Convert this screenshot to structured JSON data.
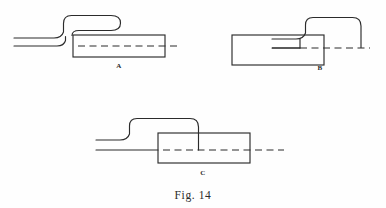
{
  "figure": {
    "caption": "Fig. 14",
    "background_color": "#fefefe",
    "line_color": "#2b2b2b",
    "panels": [
      {
        "label": "A",
        "label_x": 119,
        "label_y": 68,
        "description": "Pipe rises in an S-bend and makes a hairpin return bend above the vessel; vessel centerline remains fully hidden (dashed).",
        "vessel": {
          "x": 73,
          "y": 35,
          "width": 92,
          "height": 22
        },
        "centerline": {
          "style": "dashed",
          "x1": 78,
          "x2": 180,
          "y": 46
        },
        "pipe_upper_path": "M 14 38 L 55 38 Q 62 38 64 32 L 64 23 Q 64 16 72 16 L 112 16 Q 121 16 121 23.5 Q 121 31 112 31 L 79 31 Q 72 31 72 35",
        "pipe_lower_path": "M 14 46 L 57 46 Q 64 46 66 40 L 66 36",
        "entry_style": "hairpin-return"
      },
      {
        "label": "B",
        "label_x": 320,
        "label_y": 70,
        "description": "Pipe arches over and descends into the vessel, terminating at the centerline; centerline solid left of entry, dashed to the right.",
        "vessel": {
          "x": 232,
          "y": 35,
          "width": 92,
          "height": 30
        },
        "centerline": {
          "style": "split",
          "x1": 272,
          "x2": 370,
          "y": 48,
          "split_x": 300
        },
        "pipe_upper_path": "M 272 39 L 304 39 Q 311 39 313 33 L 313 25 Q 313 18 320 18 L 352 18 Q 361 18 361 26 L 361 47",
        "pipe_lower_path": "M 272 48 L 370 48",
        "entry_style": "descend-to-centerline",
        "entry_x": 361
      },
      {
        "label": "C",
        "label_x": 203,
        "label_y": 175,
        "description": "Pipe arches over and descends into the vessel at the centerline, which remains dashed throughout.",
        "vessel": {
          "x": 158,
          "y": 133,
          "width": 92,
          "height": 30
        },
        "centerline": {
          "style": "dashed",
          "x1": 104,
          "x2": 284,
          "y": 150
        },
        "pipe_upper_path": "M 96 140 L 122 140 Q 129 140 131 134 L 131 126 Q 131 119 138 119 L 190 119 Q 199 119 199 127 L 199 150",
        "pipe_lower_path": "M 96 150 L 158 150",
        "entry_style": "descend-to-centerline",
        "entry_x": 199
      }
    ]
  }
}
